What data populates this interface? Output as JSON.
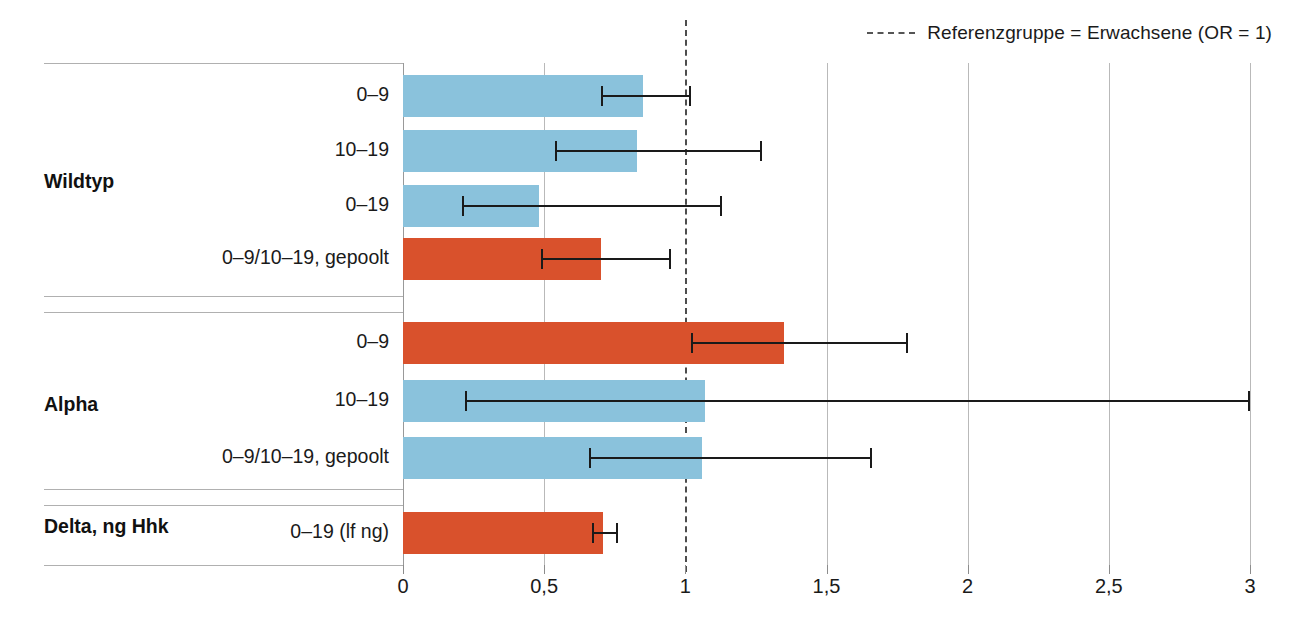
{
  "legend": {
    "dash_icon": "dashed-line-icon",
    "label": "Referenzgruppe = Erwachsene (OR = 1)"
  },
  "axis": {
    "xticks": [
      "0",
      "0,5",
      "1",
      "1,5",
      "2",
      "2,5",
      "3"
    ],
    "xtick_values": [
      0,
      0.5,
      1,
      1.5,
      2,
      2.5,
      3
    ]
  },
  "colors": {
    "blue": "#8ac2dc",
    "red": "#d9512c",
    "reference_line": "#4d4d4d",
    "gridline": "#b9b9b9",
    "error_bar": "#1a1a1a"
  },
  "groups": [
    {
      "label": "Wildtyp"
    },
    {
      "label": "Alpha"
    },
    {
      "label": "Delta, ng Hhk"
    }
  ],
  "rows": [
    {
      "group": "Wildtyp",
      "label": "0–9",
      "value": 0.85,
      "ci_low": 0.7,
      "ci_high": 1.02,
      "color": "blue"
    },
    {
      "group": "Wildtyp",
      "label": "10–19",
      "value": 0.83,
      "ci_low": 0.54,
      "ci_high": 1.27,
      "color": "blue"
    },
    {
      "group": "Wildtyp",
      "label": "0–19",
      "value": 0.48,
      "ci_low": 0.21,
      "ci_high": 1.13,
      "color": "blue"
    },
    {
      "group": "Wildtyp",
      "label": "0–9/10–19, gepoolt",
      "value": 0.7,
      "ci_low": 0.49,
      "ci_high": 0.95,
      "color": "red"
    },
    {
      "group": "Alpha",
      "label": "0–9",
      "value": 1.35,
      "ci_low": 1.02,
      "ci_high": 1.79,
      "color": "red"
    },
    {
      "group": "Alpha",
      "label": "10–19",
      "value": 1.07,
      "ci_low": 0.22,
      "ci_high": 3.0,
      "color": "blue"
    },
    {
      "group": "Alpha",
      "label": "0–9/10–19, gepoolt",
      "value": 1.06,
      "ci_low": 0.66,
      "ci_high": 1.66,
      "color": "blue"
    },
    {
      "group": "Delta, ng Hhk",
      "label": "0–19 (lf ng)",
      "value": 0.71,
      "ci_low": 0.67,
      "ci_high": 0.76,
      "color": "red"
    }
  ],
  "chart_data": {
    "type": "bar",
    "orientation": "horizontal",
    "title": "",
    "xlabel": "",
    "ylabel": "",
    "xlim": [
      0,
      3
    ],
    "xticks": [
      0,
      0.5,
      1,
      1.5,
      2,
      2.5,
      3
    ],
    "xtick_labels": [
      "0",
      "0,5",
      "1",
      "1,5",
      "2",
      "2,5",
      "3"
    ],
    "grid": "vertical",
    "legend_position": "top-right",
    "reference_line": {
      "x": 1,
      "style": "dashed",
      "label": "Referenzgruppe = Erwachsene (OR = 1)"
    },
    "groups": [
      "Wildtyp",
      "Alpha",
      "Delta, ng Hhk"
    ],
    "categories": [
      "Wildtyp | 0–9",
      "Wildtyp | 10–19",
      "Wildtyp | 0–19",
      "Wildtyp | 0–9/10–19, gepoolt",
      "Alpha | 0–9",
      "Alpha | 10–19",
      "Alpha | 0–9/10–19, gepoolt",
      "Delta, ng Hhk | 0–19 (lf ng)"
    ],
    "values": [
      0.85,
      0.83,
      0.48,
      0.7,
      1.35,
      1.07,
      1.06,
      0.71
    ],
    "ci_low": [
      0.7,
      0.54,
      0.21,
      0.49,
      1.02,
      0.22,
      0.66,
      0.67
    ],
    "ci_high": [
      1.02,
      1.27,
      1.13,
      0.95,
      1.79,
      3.0,
      1.66,
      0.76
    ],
    "bar_colors": [
      "#8ac2dc",
      "#8ac2dc",
      "#8ac2dc",
      "#d9512c",
      "#d9512c",
      "#8ac2dc",
      "#8ac2dc",
      "#d9512c"
    ]
  }
}
